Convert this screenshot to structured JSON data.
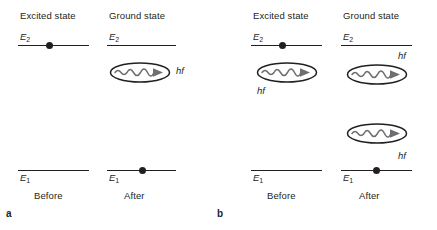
{
  "figure": {
    "type": "physics-energy-level-diagram",
    "background_color": "#ffffff",
    "ink_color": "#231f20",
    "panels": [
      {
        "letter": "a",
        "process": "spontaneous-emission",
        "columns": [
          {
            "header": "Excited state",
            "footer": "Before",
            "levels": [
              {
                "label_main": "E",
                "label_sub": "2",
                "label_position": "above-left",
                "electron": true
              },
              {
                "label_main": "E",
                "label_sub": "1",
                "label_position": "below-left",
                "electron": false
              }
            ],
            "photons": []
          },
          {
            "header": "Ground state",
            "footer": "After",
            "levels": [
              {
                "label_main": "E",
                "label_sub": "2",
                "label_position": "above-left",
                "electron": false
              },
              {
                "label_main": "E",
                "label_sub": "1",
                "label_position": "below-left",
                "electron": true
              }
            ],
            "photons": [
              {
                "label": "hf",
                "label_position": "right"
              }
            ]
          }
        ]
      },
      {
        "letter": "b",
        "process": "stimulated-emission",
        "columns": [
          {
            "header": "Excited state",
            "footer": "Before",
            "levels": [
              {
                "label_main": "E",
                "label_sub": "2",
                "label_position": "above-left",
                "electron": true
              },
              {
                "label_main": "E",
                "label_sub": "1",
                "label_position": "below-left",
                "electron": false
              }
            ],
            "photons": [
              {
                "label": "hf",
                "label_position": "below-left"
              }
            ]
          },
          {
            "header": "Ground state",
            "footer": "After",
            "levels": [
              {
                "label_main": "E",
                "label_sub": "2",
                "label_position": "above-left",
                "electron": false
              },
              {
                "label_main": "E",
                "label_sub": "1",
                "label_position": "below-left",
                "electron": true
              }
            ],
            "photons": [
              {
                "label": "hf",
                "label_position": "above-right"
              },
              {
                "label": "hf",
                "label_position": "below-right"
              }
            ]
          }
        ]
      }
    ]
  },
  "labels": {
    "excited_state": "Excited state",
    "ground_state": "Ground state",
    "before": "Before",
    "after": "After",
    "E2_main": "E",
    "E2_sub": "2",
    "E1_main": "E",
    "E1_sub": "1",
    "hf": "hf",
    "panel_a": "a",
    "panel_b": "b"
  }
}
